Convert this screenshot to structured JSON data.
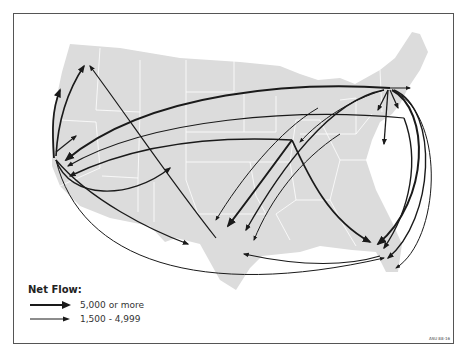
{
  "map": {
    "subject": "US migration net flows",
    "colors": {
      "land": "#dcdcdc",
      "borders": "#ffffff",
      "arrows": "#1a1a1a",
      "frame": "#555555"
    }
  },
  "legend": {
    "title": "Net Flow:",
    "items": [
      {
        "label": "5,000 or more",
        "weight": "thick"
      },
      {
        "label": "1,500 - 4,999",
        "weight": "thin"
      }
    ]
  },
  "figure_code": "ASU 88-16"
}
